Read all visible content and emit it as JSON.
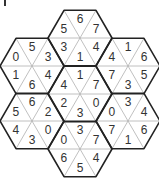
{
  "corner_mark": "|",
  "hexagons": [
    {
      "id": "top",
      "cx": 80,
      "cy": 38,
      "values": [
        "5",
        "6",
        "7",
        "4",
        "1",
        "3"
      ]
    },
    {
      "id": "upper-left",
      "cx": 32,
      "cy": 66,
      "values": [
        "0",
        "5",
        "3",
        "4",
        "6",
        "1"
      ]
    },
    {
      "id": "upper-right",
      "cx": 128,
      "cy": 66,
      "values": [
        "4",
        "1",
        "6",
        "5",
        "3",
        "7"
      ]
    },
    {
      "id": "center",
      "cx": 80,
      "cy": 94,
      "values": [
        "4",
        "1",
        "7",
        "0",
        "3",
        "2"
      ]
    },
    {
      "id": "lower-left",
      "cx": 32,
      "cy": 121,
      "values": [
        "5",
        "6",
        "2",
        "0",
        "3",
        "4"
      ]
    },
    {
      "id": "lower-right",
      "cx": 128,
      "cy": 121,
      "values": [
        "0",
        "3",
        "4",
        "6",
        "1",
        "7"
      ]
    },
    {
      "id": "bottom",
      "cx": 80,
      "cy": 149,
      "values": [
        "0",
        "3",
        "7",
        "4",
        "5",
        "6"
      ]
    }
  ],
  "colors": {
    "outer": "#222222",
    "inner": "#b0b0b0",
    "text": "#333333"
  }
}
